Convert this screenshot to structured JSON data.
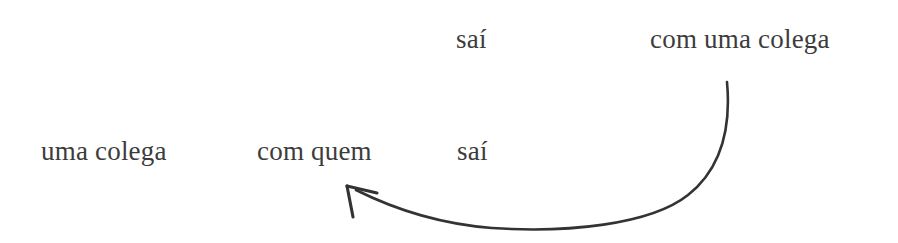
{
  "figure": {
    "kind": "syntactic-movement-diagram",
    "language": "Portuguese",
    "background_color": "#ffffff",
    "text_color": "#3c3c3c",
    "arrow_color": "#333333"
  },
  "rows": {
    "upper": {
      "tokens": [
        {
          "id": "sai-upper",
          "text": "saí"
        },
        {
          "id": "com-uma-colega",
          "text": "com uma colega"
        }
      ]
    },
    "lower": {
      "tokens": [
        {
          "id": "uma-colega",
          "text": "uma colega"
        },
        {
          "id": "com-quem",
          "text": "com quem"
        },
        {
          "id": "sai-lower",
          "text": "saí"
        }
      ]
    }
  },
  "arrow": {
    "name": "movement-arrow",
    "direction": "right-to-left",
    "origin_token": "com uma colega",
    "target_token": "com quem",
    "start_point": {
      "x": 727,
      "y": 82
    },
    "end_point": {
      "x": 347,
      "y": 186
    },
    "apex_point": {
      "x": 492,
      "y": 228
    },
    "stroke_width": 2.6,
    "color": "#333333"
  }
}
